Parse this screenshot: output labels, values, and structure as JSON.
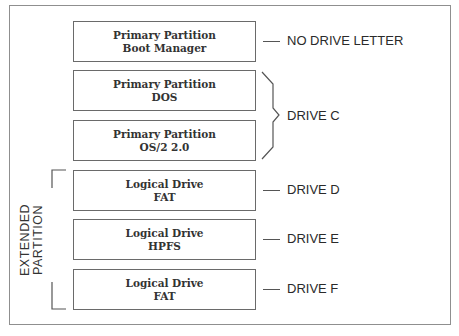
{
  "diagram": {
    "partitions": [
      {
        "line1": "Primary Partition",
        "line2": "Boot Manager",
        "drive": "NO DRIVE LETTER"
      },
      {
        "line1": "Primary Partition",
        "line2": "DOS",
        "drive": "DRIVE C"
      },
      {
        "line1": "Primary Partition",
        "line2": "OS/2 2.0",
        "drive": "DRIVE C"
      },
      {
        "line1": "Logical Drive",
        "line2": "FAT",
        "drive": "DRIVE D"
      },
      {
        "line1": "Logical Drive",
        "line2": "HPFS",
        "drive": "DRIVE E"
      },
      {
        "line1": "Logical Drive",
        "line2": "FAT",
        "drive": "DRIVE F"
      }
    ],
    "labels": {
      "no_drive_letter": "NO DRIVE LETTER",
      "drive_c": "DRIVE C",
      "drive_d": "DRIVE D",
      "drive_e": "DRIVE E",
      "drive_f": "DRIVE F"
    },
    "extended_partition": {
      "line1": "EXTENDED",
      "line2": "PARTITION"
    },
    "colors": {
      "line": "#555555",
      "box_border": "#6a6a6a",
      "text": "#333333",
      "frame": "#8f8f8f"
    }
  }
}
